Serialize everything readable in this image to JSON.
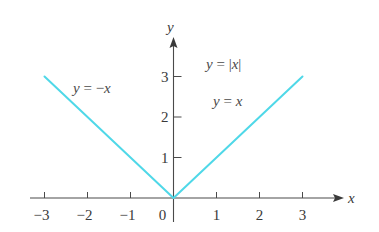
{
  "chart_data": {
    "type": "line",
    "title": "",
    "xlabel": "x",
    "ylabel": "y",
    "xlim": [
      -3,
      3
    ],
    "ylim": [
      0,
      3
    ],
    "x_ticks": [
      -3,
      -2,
      -1,
      0,
      1,
      2,
      3
    ],
    "x_tick_labels": [
      "−3",
      "−2",
      "−1",
      "0",
      "1",
      "2",
      "3"
    ],
    "y_ticks": [
      1,
      2,
      3
    ],
    "y_tick_labels": [
      "1",
      "2",
      "3"
    ],
    "grid": false,
    "line_color": "#4fd8e8",
    "series": [
      {
        "name": "y = |x|",
        "x": [
          -3,
          -2,
          -1,
          0,
          1,
          2,
          3
        ],
        "y": [
          3,
          2,
          1,
          0,
          1,
          2,
          3
        ]
      }
    ],
    "annotations": [
      {
        "text_parts": [
          "y",
          " = −",
          "x"
        ],
        "label": "y = −x",
        "near_x": -2,
        "near_y": 2.7
      },
      {
        "text_parts": [
          "y",
          " = |",
          "x",
          "|"
        ],
        "label": "y = |x|",
        "near_x": 0.9,
        "near_y": 3.5
      },
      {
        "text_parts": [
          "y",
          " = ",
          "x"
        ],
        "label": "y = x",
        "near_x": 1.2,
        "near_y": 2.5
      }
    ]
  }
}
